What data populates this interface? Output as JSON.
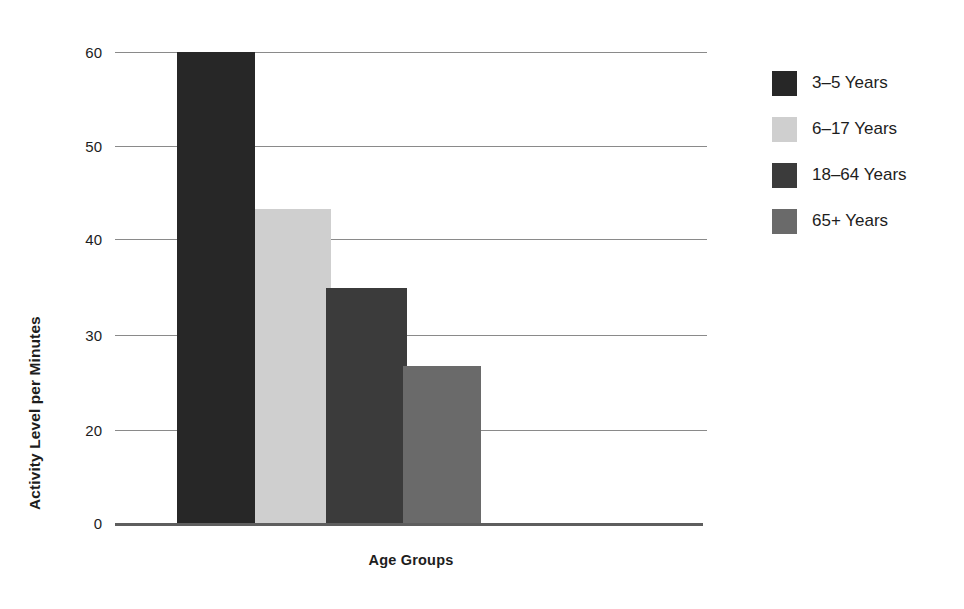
{
  "chart_data": {
    "type": "bar",
    "title": "",
    "subtitle": "",
    "xlabel": "Age Groups",
    "ylabel": "Activity Level per Minutes",
    "categories": [
      "3-5 Years",
      "6-17 Years",
      "18-64 Years",
      "65+ Years"
    ],
    "values": [
      60,
      40,
      30,
      20
    ],
    "series": [
      {
        "name": "Activity Level per Minutes",
        "values": [
          60,
          40,
          30,
          20
        ]
      }
    ],
    "ylim": [
      0,
      60
    ],
    "ytick_labels": [
      "60",
      "50",
      "40",
      "30",
      "20",
      "0"
    ],
    "ytick_values": [
      60,
      50,
      40,
      30,
      20,
      10
    ],
    "grid": "horizontal",
    "xtick_labels": [],
    "legend_position": "right",
    "bar_colors": [
      "#272727",
      "#cfcfcf",
      "#3b3b3b",
      "#6a6a6a"
    ],
    "annotations": []
  },
  "axes": {
    "y_title": "Activity Level per Minutes",
    "x_title": "Age Groups",
    "grid_color": "#8a8a8a",
    "baseline_color": "#5e5e5e"
  },
  "legend": {
    "items": [
      {
        "label": "3–5 Years",
        "color": "#272727",
        "swatch_name": "legend-swatch-3-5-years"
      },
      {
        "label": "6–17 Years",
        "color": "#cfcfcf",
        "swatch_name": "legend-swatch-6-17-years"
      },
      {
        "label": "18–64 Years",
        "color": "#3b3b3b",
        "swatch_name": "legend-swatch-18-64-years"
      },
      {
        "label": "65+ Years",
        "color": "#6a6a6a",
        "swatch_name": "legend-swatch-65-plus-years"
      }
    ]
  },
  "bars": [
    {
      "label": "3-5 Years",
      "value": 60,
      "color": "#272727",
      "left": 62,
      "width": 78
    },
    {
      "label": "6-17 Years",
      "value": 40,
      "color": "#cfcfcf",
      "left": 140,
      "width": 76
    },
    {
      "label": "18-64 Years",
      "value": 30,
      "color": "#3b3b3b",
      "left": 211,
      "width": 81
    },
    {
      "label": "65+ Years",
      "value": 20,
      "color": "#6a6a6a",
      "left": 288,
      "width": 78
    }
  ],
  "ticks": [
    {
      "label": "60",
      "y": 12
    },
    {
      "label": "50",
      "y": 106
    },
    {
      "label": "40",
      "y": 199
    },
    {
      "label": "30",
      "y": 295
    },
    {
      "label": "20",
      "y": 390
    },
    {
      "label": "0",
      "y": 483
    }
  ]
}
